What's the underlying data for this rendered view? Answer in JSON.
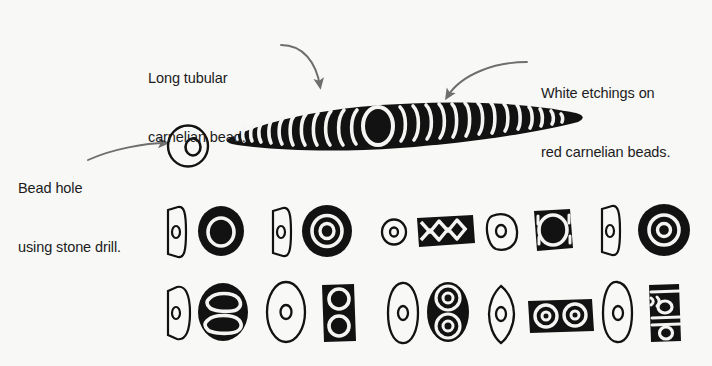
{
  "figure": {
    "background_color": "#f8f8f6",
    "ink_color": "#121212",
    "arrow_color": "#6e6e6e",
    "text_color": "#1c1c1c",
    "width": 712,
    "height": 366
  },
  "annotations": [
    {
      "id": "long-tubular",
      "line1": "Long tubular",
      "line2": "carnelian bead.",
      "points_to": "long-tubular-bead"
    },
    {
      "id": "white-etchings",
      "line1": "White etchings on",
      "line2": "red carnelian beads.",
      "points_to": "etched-arcs"
    },
    {
      "id": "bead-hole",
      "line1": "Bead hole",
      "line2": "using stone drill.",
      "points_to": "bead-hole-detail"
    }
  ],
  "specimens": {
    "detail_circle": {
      "name": "bead-hole-detail",
      "description": "circle outline with small drilled oval hole"
    },
    "long_bead": {
      "name": "long-tubular-bead",
      "description": "long lenticular black bead with white etched arcs and central oval",
      "arc_count_left": 13,
      "arc_count_right": 14,
      "center_motif": "oval ring"
    },
    "rows": [
      {
        "row": 1,
        "pairs": [
          {
            "profile": "rounded-rectangle-side-view",
            "face": "solid-disc-with-ring-and-hole",
            "label": "bead-pair-1"
          },
          {
            "profile": "rounded-rectangle-side-view",
            "face": "concentric-double-ring-disc",
            "label": "bead-pair-2"
          },
          {
            "profile": "small-circle-side-view",
            "face": "rectangular-bead-zigzag-chevrons",
            "label": "bead-pair-3"
          },
          {
            "profile": "oval-outline-side-view",
            "face": "square-bead-ring-with-corner-arcs",
            "label": "bead-pair-4"
          },
          {
            "profile": "rounded-rectangle-side-view",
            "face": "concentric-ring-disc",
            "label": "bead-pair-5"
          }
        ]
      },
      {
        "row": 2,
        "pairs": [
          {
            "profile": "half-round-side-view",
            "face": "oval-bead-double-lobe-outline",
            "label": "bead-pair-6"
          },
          {
            "profile": "tall-oval-outline-side-view",
            "face": "rectangular-bead-figure-eight",
            "label": "bead-pair-7"
          },
          {
            "profile": "tall-leaf-outline-side-view",
            "face": "oval-bead-two-concentric-circles",
            "label": "bead-pair-8"
          },
          {
            "profile": "pointed-oval-side-view",
            "face": "rectangular-bead-two-eyes",
            "label": "bead-pair-9"
          },
          {
            "profile": "tall-leaf-outline-side-view",
            "face": "rectangular-bead-banded-stripes",
            "label": "bead-pair-10"
          }
        ]
      }
    ]
  }
}
